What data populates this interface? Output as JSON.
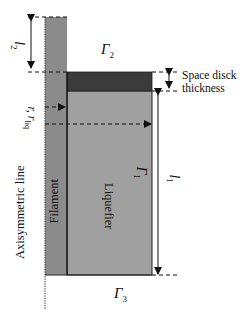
{
  "diagram": {
    "type": "axisymmetric liquefier schematic",
    "regions": {
      "filament": {
        "label": "Filament",
        "color": "#8b8b8b"
      },
      "liquefier": {
        "label": "Liquefier",
        "color": "#a0a0a0"
      },
      "space_disk": {
        "color": "#3b3b3b"
      }
    },
    "axis_label": "Axisymmetric line",
    "dimensions": {
      "l2": {
        "symbol": "l",
        "subscript": "2"
      },
      "l1": {
        "symbol": "l",
        "subscript": "1"
      },
      "r": {
        "symbol": "r"
      },
      "r_liq": {
        "symbol": "r",
        "subscript": "liq"
      },
      "space_disk_thickness": {
        "line1": "Space disck",
        "line2": "thickness"
      }
    },
    "boundaries": {
      "gamma1": {
        "symbol": "Γ",
        "subscript": "1"
      },
      "gamma2": {
        "symbol": "Γ",
        "subscript": "2"
      },
      "gamma3": {
        "symbol": "Γ",
        "subscript": "3"
      }
    },
    "colors": {
      "line": "#111111",
      "background": "#ffffff"
    }
  }
}
